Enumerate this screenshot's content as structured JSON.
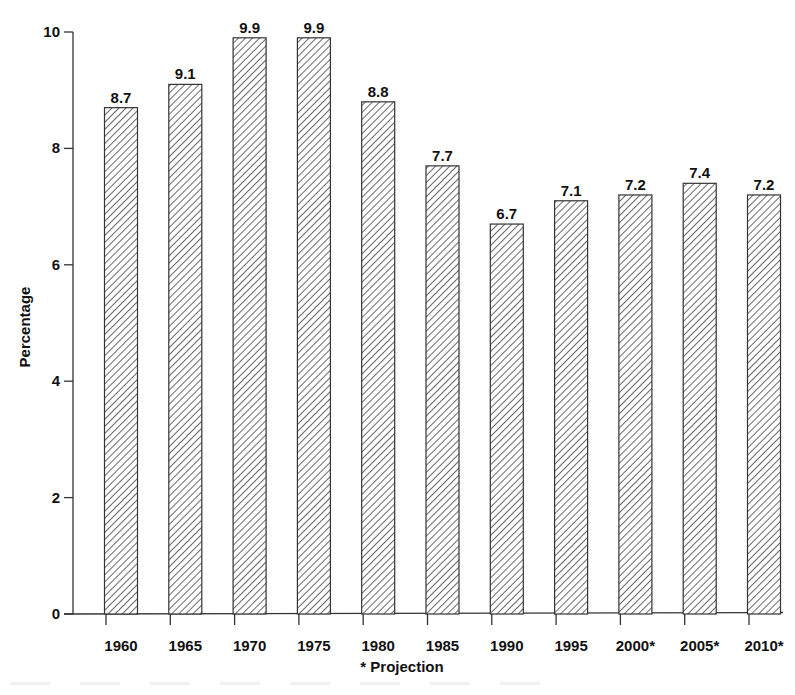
{
  "chart_data": {
    "type": "bar",
    "title": "",
    "xlabel": "* Projection",
    "ylabel": "Percentage",
    "categories": [
      "1960",
      "1965",
      "1970",
      "1975",
      "1980",
      "1985",
      "1990",
      "1995",
      "2000*",
      "2005*",
      "2010*"
    ],
    "values": [
      8.7,
      9.1,
      9.9,
      9.9,
      8.8,
      7.7,
      6.7,
      7.1,
      7.2,
      7.4,
      7.2
    ],
    "data_labels": [
      "8.7",
      "9.1",
      "9.9",
      "9.9",
      "8.8",
      "7.7",
      "6.7",
      "7.1",
      "7.2",
      "7.4",
      "7.2"
    ],
    "ylim": [
      0,
      10
    ],
    "yticks": [
      0,
      2,
      4,
      6,
      8,
      10
    ],
    "grid": false,
    "legend": null,
    "bar_fill": "diagonal-hatch",
    "colors": {
      "bar_stroke": "#333333",
      "hatch": "#444444",
      "axis": "#333333",
      "text": "#111111"
    }
  }
}
